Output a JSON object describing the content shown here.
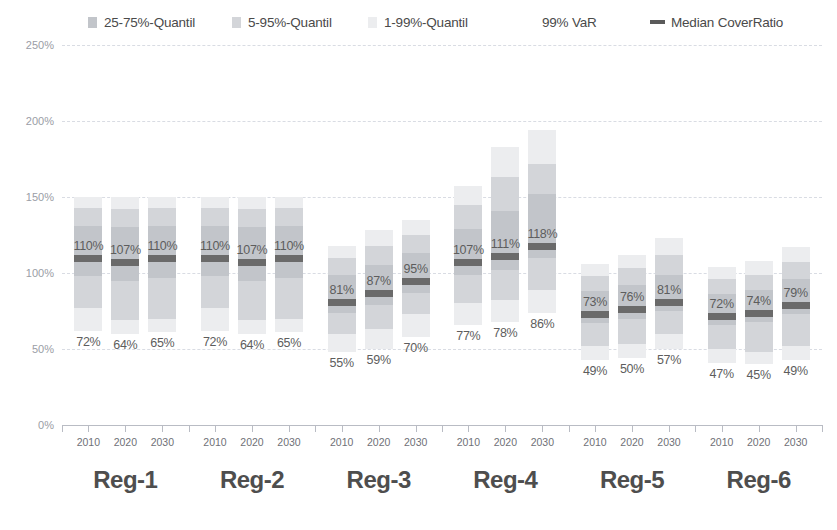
{
  "legend": {
    "items": [
      {
        "label": "25-75%-Quantil",
        "marker": "swatch",
        "color": "#c2c5ca",
        "x": 88
      },
      {
        "label": "5-95%-Quantil",
        "marker": "swatch",
        "color": "#d3d5d9",
        "x": 232
      },
      {
        "label": "1-99%-Quantil",
        "marker": "swatch",
        "color": "#ecedef",
        "x": 368
      },
      {
        "label": "99% VaR",
        "marker": "none",
        "color": "#4a4a4a",
        "x": 542
      },
      {
        "label": "Median CoverRatio",
        "marker": "line",
        "color": "#5a5a5a",
        "x": 650
      }
    ]
  },
  "axis": {
    "y_ticks": [
      "250%",
      "200%",
      "150%",
      "100%",
      "50%",
      "0%"
    ],
    "y_values": [
      250,
      200,
      150,
      100,
      50,
      0
    ],
    "ymin": 0,
    "ymax": 250
  },
  "chart_data": {
    "type": "bar",
    "title": "",
    "xlabel": "",
    "ylabel": "",
    "ylim": [
      0,
      250
    ],
    "grid": true,
    "legend_position": "top",
    "ytick_labels": [
      "0%",
      "50%",
      "100%",
      "150%",
      "200%",
      "250%"
    ],
    "groups": [
      "Reg-1",
      "Reg-2",
      "Reg-3",
      "Reg-4",
      "Reg-5",
      "Reg-6"
    ],
    "categories": [
      "2010",
      "2020",
      "2030"
    ],
    "series_definition": [
      {
        "name": "1-99%-Quantil",
        "color": "#ecedef"
      },
      {
        "name": "5-95%-Quantil",
        "color": "#d3d5d9"
      },
      {
        "name": "25-75%-Quantil",
        "color": "#c2c5ca"
      },
      {
        "name": "Median CoverRatio",
        "color": "#6a6a6a"
      }
    ],
    "bars": [
      {
        "group": "Reg-1",
        "year": "2010",
        "q01": 62,
        "q05": 77,
        "q25": 98,
        "median": 110,
        "q75": 131,
        "q95": 143,
        "q99": 150,
        "median_label": "110%",
        "var_label": "72%",
        "var_value": 72
      },
      {
        "group": "Reg-1",
        "year": "2020",
        "q01": 60,
        "q05": 69,
        "q25": 95,
        "median": 107,
        "q75": 130,
        "q95": 142,
        "q99": 150,
        "median_label": "107%",
        "var_label": "64%",
        "var_value": 64
      },
      {
        "group": "Reg-1",
        "year": "2030",
        "q01": 61,
        "q05": 70,
        "q25": 97,
        "median": 110,
        "q75": 131,
        "q95": 143,
        "q99": 150,
        "median_label": "110%",
        "var_label": "65%",
        "var_value": 65
      },
      {
        "group": "Reg-2",
        "year": "2010",
        "q01": 62,
        "q05": 77,
        "q25": 98,
        "median": 110,
        "q75": 131,
        "q95": 143,
        "q99": 150,
        "median_label": "110%",
        "var_label": "72%",
        "var_value": 72
      },
      {
        "group": "Reg-2",
        "year": "2020",
        "q01": 60,
        "q05": 69,
        "q25": 95,
        "median": 107,
        "q75": 130,
        "q95": 142,
        "q99": 150,
        "median_label": "107%",
        "var_label": "64%",
        "var_value": 64
      },
      {
        "group": "Reg-2",
        "year": "2030",
        "q01": 61,
        "q05": 70,
        "q25": 97,
        "median": 110,
        "q75": 131,
        "q95": 143,
        "q99": 150,
        "median_label": "110%",
        "var_label": "65%",
        "var_value": 65
      },
      {
        "group": "Reg-3",
        "year": "2010",
        "q01": 48,
        "q05": 60,
        "q25": 74,
        "median": 81,
        "q75": 99,
        "q95": 110,
        "q99": 118,
        "median_label": "81%",
        "var_label": "55%",
        "var_value": 55
      },
      {
        "group": "Reg-3",
        "year": "2020",
        "q01": 50,
        "q05": 63,
        "q25": 79,
        "median": 87,
        "q75": 105,
        "q95": 118,
        "q99": 128,
        "median_label": "87%",
        "var_label": "59%",
        "var_value": 59
      },
      {
        "group": "Reg-3",
        "year": "2030",
        "q01": 58,
        "q05": 73,
        "q25": 87,
        "median": 95,
        "q75": 113,
        "q95": 125,
        "q99": 135,
        "median_label": "95%",
        "var_label": "70%",
        "var_value": 70
      },
      {
        "group": "Reg-4",
        "year": "2010",
        "q01": 66,
        "q05": 80,
        "q25": 99,
        "median": 107,
        "q75": 129,
        "q95": 145,
        "q99": 157,
        "median_label": "107%",
        "var_label": "77%",
        "var_value": 77
      },
      {
        "group": "Reg-4",
        "year": "2020",
        "q01": 68,
        "q05": 82,
        "q25": 102,
        "median": 111,
        "q75": 141,
        "q95": 163,
        "q99": 183,
        "median_label": "111%",
        "var_label": "78%",
        "var_value": 78
      },
      {
        "group": "Reg-4",
        "year": "2030",
        "q01": 74,
        "q05": 89,
        "q25": 110,
        "median": 118,
        "q75": 152,
        "q95": 172,
        "q99": 194,
        "median_label": "118%",
        "var_label": "86%",
        "var_value": 86
      },
      {
        "group": "Reg-5",
        "year": "2010",
        "q01": 43,
        "q05": 52,
        "q25": 67,
        "median": 73,
        "q75": 88,
        "q95": 98,
        "q99": 106,
        "median_label": "73%",
        "var_label": "49%",
        "var_value": 49
      },
      {
        "group": "Reg-5",
        "year": "2020",
        "q01": 44,
        "q05": 53,
        "q25": 70,
        "median": 76,
        "q75": 92,
        "q95": 103,
        "q99": 112,
        "median_label": "76%",
        "var_label": "50%",
        "var_value": 50
      },
      {
        "group": "Reg-5",
        "year": "2030",
        "q01": 50,
        "q05": 60,
        "q25": 75,
        "median": 81,
        "q75": 99,
        "q95": 112,
        "q99": 123,
        "median_label": "81%",
        "var_label": "57%",
        "var_value": 57
      },
      {
        "group": "Reg-6",
        "year": "2010",
        "q01": 41,
        "q05": 50,
        "q25": 66,
        "median": 72,
        "q75": 86,
        "q95": 96,
        "q99": 104,
        "median_label": "72%",
        "var_label": "47%",
        "var_value": 47
      },
      {
        "group": "Reg-6",
        "year": "2020",
        "q01": 40,
        "q05": 48,
        "q25": 68,
        "median": 74,
        "q75": 89,
        "q95": 99,
        "q99": 108,
        "median_label": "74%",
        "var_label": "45%",
        "var_value": 45
      },
      {
        "group": "Reg-6",
        "year": "2030",
        "q01": 43,
        "q05": 52,
        "q25": 73,
        "median": 79,
        "q75": 96,
        "q95": 107,
        "q99": 117,
        "median_label": "79%",
        "var_label": "49%",
        "var_value": 49
      }
    ]
  }
}
